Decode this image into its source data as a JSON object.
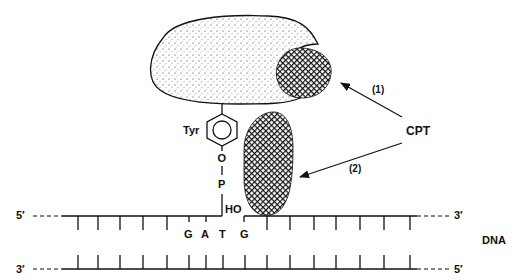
{
  "figure": {
    "type": "diagram"
  },
  "labels": {
    "tyrosine": "Tyr",
    "oxygen": "O",
    "phosphorus": "P",
    "hydroxyl": "HO",
    "drug": "CPT",
    "pathway1": "(1)",
    "pathway2": "(2)",
    "dna": "DNA",
    "top_strand_left_end": "5′",
    "top_strand_right_end": "3′",
    "bottom_strand_left_end": "3′",
    "bottom_strand_right_end": "5′"
  },
  "sequence": {
    "bases": [
      "G",
      "A",
      "T",
      "G"
    ]
  },
  "colors": {
    "ink": "#111111",
    "background": "#ffffff"
  }
}
